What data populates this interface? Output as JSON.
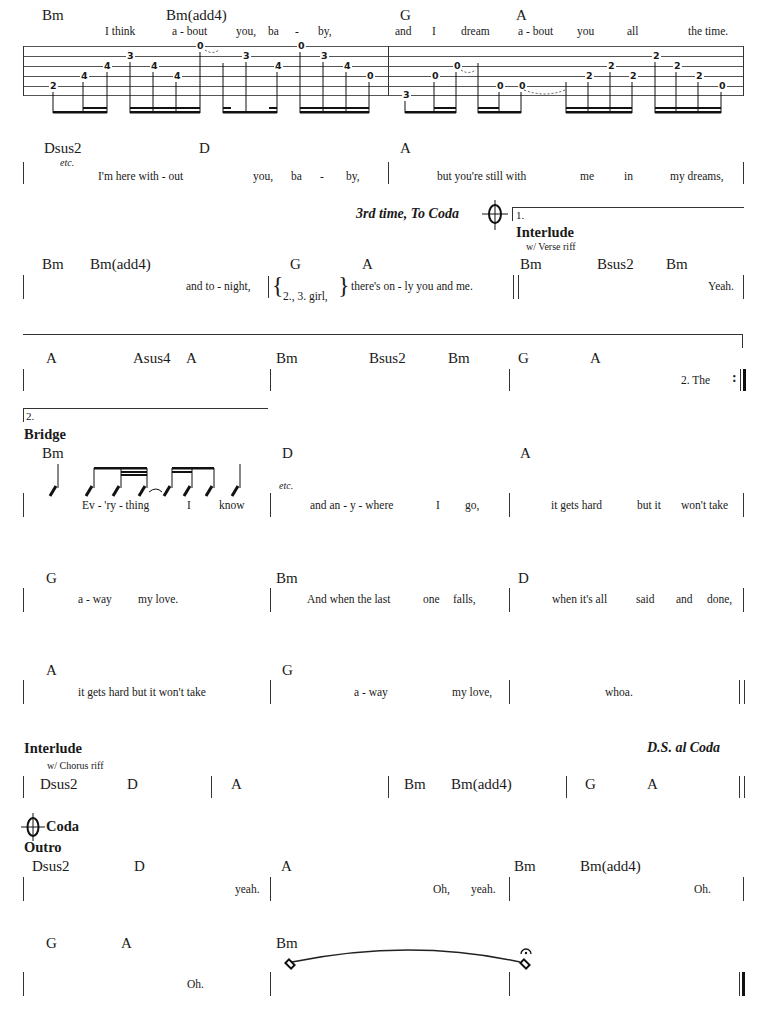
{
  "system1": {
    "chords": [
      "Bm",
      "Bm(add4)",
      "G",
      "A"
    ],
    "lyrics": [
      "I think",
      "a - bout",
      "you,",
      "ba",
      "-",
      "by,",
      "and",
      "I",
      "dream",
      "a - bout",
      "you",
      "all",
      "the time."
    ],
    "tab_numbers": [
      "2",
      "4",
      "4",
      "3",
      "4",
      "4",
      "0",
      "3",
      "4",
      "0",
      "3",
      "4",
      "0",
      "3",
      "0",
      "0",
      "0",
      "0",
      "2",
      "2",
      "2",
      "2",
      "2",
      "2",
      "0"
    ]
  },
  "system2": {
    "chords": [
      "Dsus2",
      "D",
      "A"
    ],
    "etc": "etc.",
    "lyrics": [
      "I'm here with - out",
      "you,",
      "ba",
      "-",
      "by,",
      "but you're still with",
      "me",
      "in",
      "my dreams,"
    ],
    "direction": "3rd time, To Coda",
    "ending1_label": "1.",
    "interlude_label": "Interlude",
    "riff_label": "w/ Verse riff"
  },
  "system3": {
    "chords": [
      "Bm",
      "Bm(add4)",
      "G",
      "A",
      "Bm",
      "Bsus2",
      "Bm"
    ],
    "lyrics": [
      "and to - night,",
      "2., 3. girl,",
      "there's on - ly you and me.",
      "Yeah."
    ]
  },
  "system4": {
    "chords": [
      "A",
      "Asus4",
      "A",
      "Bm",
      "Bsus2",
      "Bm",
      "G",
      "A"
    ],
    "lyrics": [
      "2.  The"
    ]
  },
  "system5": {
    "ending2_label": "2.",
    "section": "Bridge",
    "chords": [
      "Bm",
      "D",
      "A"
    ],
    "etc": "etc.",
    "lyrics": [
      "Ev - 'ry - thing",
      "I",
      "know",
      "and an  -  y - where",
      "I",
      "go,",
      "it gets hard",
      "but it",
      "won't take"
    ]
  },
  "system6": {
    "chords": [
      "G",
      "Bm",
      "D"
    ],
    "lyrics": [
      "a - way",
      "my love.",
      "And when the last",
      "one",
      "falls,",
      "when it's all",
      "said",
      "and",
      "done,"
    ]
  },
  "system7": {
    "chords": [
      "A",
      "G"
    ],
    "lyrics": [
      "it gets hard  but it won't take",
      "a - way",
      "my love,",
      "whoa."
    ]
  },
  "system8": {
    "section": "Interlude",
    "riff_label": "w/ Chorus riff",
    "direction": "D.S. al Coda",
    "chords": [
      "Dsus2",
      "D",
      "A",
      "Bm",
      "Bm(add4)",
      "G",
      "A"
    ]
  },
  "system9": {
    "coda_label": "Coda",
    "section": "Outro",
    "chords": [
      "Dsus2",
      "D",
      "A",
      "Bm",
      "Bm(add4)"
    ],
    "lyrics": [
      "yeah.",
      "Oh,",
      "yeah.",
      "Oh."
    ]
  },
  "system10": {
    "chords": [
      "G",
      "A",
      "Bm"
    ],
    "lyrics": [
      "Oh."
    ]
  }
}
